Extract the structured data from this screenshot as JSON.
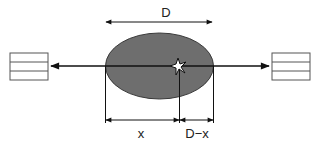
{
  "diagram": {
    "labels": {
      "top_dimension": "D",
      "left_segment": "x",
      "right_segment": "D−x"
    },
    "elements": {
      "ellipse": {
        "fill": "#6e6e6e",
        "stroke": "#3a3a3a"
      },
      "left_box": {
        "rows": 3
      },
      "right_box": {
        "rows": 3
      },
      "source_marker": "star-burst"
    },
    "colors": {
      "line": "#111111",
      "box_stroke": "#555555",
      "background": "#ffffff"
    }
  }
}
